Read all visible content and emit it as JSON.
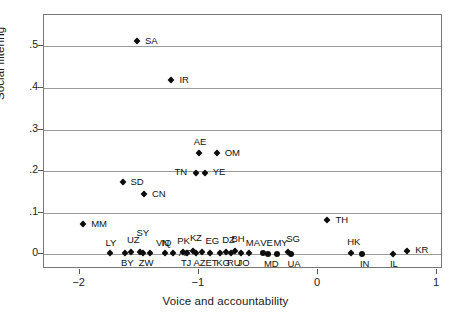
{
  "chart_data": {
    "type": "scatter",
    "title": "",
    "xlabel": "Voice and accountability",
    "ylabel": "Social filtering",
    "xlim": [
      -2.3,
      1.05
    ],
    "ylim": [
      -0.035,
      0.575
    ],
    "xticks": [
      -2,
      -1,
      0,
      1
    ],
    "xtick_labels": [
      "−2",
      "−1",
      "0",
      "1"
    ],
    "yticks": [
      0,
      0.1,
      0.2,
      0.3,
      0.4,
      0.5
    ],
    "ytick_labels": [
      "0",
      ".1",
      ".2",
      ".3",
      ".4",
      ".5"
    ],
    "grid": "horizontal",
    "legend": "none",
    "marker": "filled-diamond",
    "points": [
      {
        "label": "SA",
        "x": -1.52,
        "y": 0.513,
        "lx": 8,
        "ly": -5
      },
      {
        "label": "IR",
        "x": -1.23,
        "y": 0.42,
        "lx": 8,
        "ly": -5
      },
      {
        "label": "AE",
        "x": -1.0,
        "y": 0.243,
        "lx": -5,
        "ly": -16
      },
      {
        "label": "OM",
        "x": -0.85,
        "y": 0.243,
        "lx": 8,
        "ly": -5
      },
      {
        "label": "TN",
        "x": -1.02,
        "y": 0.196,
        "lx": -22,
        "ly": -6
      },
      {
        "label": "YE",
        "x": -0.95,
        "y": 0.196,
        "lx": 8,
        "ly": -6
      },
      {
        "label": "SD",
        "x": -1.64,
        "y": 0.175,
        "lx": 8,
        "ly": -5
      },
      {
        "label": "CN",
        "x": -1.46,
        "y": 0.145,
        "lx": 8,
        "ly": -5
      },
      {
        "label": "TH",
        "x": 0.08,
        "y": 0.083,
        "lx": 8,
        "ly": -5
      },
      {
        "label": "MM",
        "x": -1.97,
        "y": 0.073,
        "lx": 8,
        "ly": -5
      },
      {
        "label": "LY",
        "x": -1.75,
        "y": 0.003,
        "lx": -4,
        "ly": -15
      },
      {
        "label": "BY",
        "x": -1.62,
        "y": 0.003,
        "lx": -4,
        "ly": 5
      },
      {
        "label": "UZ",
        "x": -1.57,
        "y": 0.006,
        "lx": -4,
        "ly": -17
      },
      {
        "label": "SY",
        "x": -1.49,
        "y": 0.006,
        "lx": -4,
        "ly": -24
      },
      {
        "label": "ZW",
        "x": -1.47,
        "y": 0.003,
        "lx": -4,
        "ly": 5
      },
      {
        "label": "VN",
        "x": -1.41,
        "y": 0.003,
        "lx": 6,
        "ly": -15
      },
      {
        "label": "IQ",
        "x": -1.28,
        "y": 0.003,
        "lx": -4,
        "ly": -15
      },
      {
        "label": "AF",
        "x": -1.22,
        "y": 0.003,
        "lx": 6,
        "ly": -5
      },
      {
        "label": "PK",
        "x": -1.13,
        "y": 0.006,
        "lx": -6,
        "ly": -16
      },
      {
        "label": "TJ",
        "x": -1.1,
        "y": 0.003,
        "lx": -6,
        "ly": 5
      },
      {
        "label": "KZ",
        "x": -1.05,
        "y": 0.008,
        "lx": -3,
        "ly": -18
      },
      {
        "label": "AZ",
        "x": -1.02,
        "y": 0.003,
        "lx": -3,
        "ly": 5
      },
      {
        "label": "EG",
        "x": -0.97,
        "y": 0.006,
        "lx": 3,
        "ly": -16
      },
      {
        "label": "ET",
        "x": -0.91,
        "y": 0.003,
        "lx": -4,
        "ly": 5
      },
      {
        "label": "KG",
        "x": -0.82,
        "y": 0.003,
        "lx": -4,
        "ly": 5
      },
      {
        "label": "DZ",
        "x": -0.77,
        "y": 0.006,
        "lx": -4,
        "ly": -17
      },
      {
        "label": "RU",
        "x": -0.73,
        "y": 0.003,
        "lx": -4,
        "ly": 5
      },
      {
        "label": "BH",
        "x": -0.7,
        "y": 0.008,
        "lx": -3,
        "ly": -17
      },
      {
        "label": "JO",
        "x": -0.65,
        "y": 0.003,
        "lx": -3,
        "ly": 5
      },
      {
        "label": "MA",
        "x": -0.58,
        "y": 0.003,
        "lx": -3,
        "ly": -15
      },
      {
        "label": "VE",
        "x": -0.46,
        "y": 0.003,
        "lx": -3,
        "ly": -15
      },
      {
        "label": "MD",
        "x": -0.42,
        "y": 0.001,
        "lx": -4,
        "ly": 5
      },
      {
        "label": "MY",
        "x": -0.34,
        "y": 0.001,
        "lx": -4,
        "ly": -16
      },
      {
        "label": "SG",
        "x": -0.25,
        "y": 0.006,
        "lx": -2,
        "ly": -18
      },
      {
        "label": "UA",
        "x": -0.23,
        "y": 0.001,
        "lx": -3,
        "ly": 5
      },
      {
        "label": "HK",
        "x": 0.28,
        "y": 0.003,
        "lx": -4,
        "ly": -16
      },
      {
        "label": "IN",
        "x": 0.37,
        "y": 0.001,
        "lx": -2,
        "ly": 5
      },
      {
        "label": "IL",
        "x": 0.63,
        "y": 0.001,
        "lx": -3,
        "ly": 5
      },
      {
        "label": "KR",
        "x": 0.75,
        "y": 0.008,
        "lx": 8,
        "ly": -6
      }
    ],
    "large_markers": [
      "MD",
      "MY",
      "UA",
      "IN",
      "VE"
    ]
  },
  "colors": {
    "marker": "#0d0d0d",
    "grid": "#9a9a9a",
    "frame": "#777777",
    "text": "#1a1a1a",
    "background": "#ffffff"
  }
}
